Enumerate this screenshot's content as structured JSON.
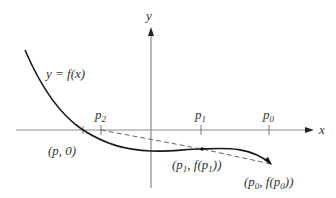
{
  "diagram": {
    "axes": {
      "x_label": "x",
      "y_label": "y",
      "color": "#888888"
    },
    "curve": {
      "label": "y = f(x)",
      "color": "#1a1a1a"
    },
    "secant_line": {
      "style": "dashed",
      "color": "#666666"
    },
    "ticks": [
      {
        "id": "p2",
        "base": "p",
        "sub": "2"
      },
      {
        "id": "p1",
        "base": "p",
        "sub": "1"
      },
      {
        "id": "p0",
        "base": "p",
        "sub": "0"
      }
    ],
    "points": [
      {
        "id": "root",
        "label": "(p, 0)"
      },
      {
        "id": "p1_point",
        "label_parts": [
          "(p",
          "1",
          ", f(p",
          "1",
          "))"
        ]
      },
      {
        "id": "p0_point",
        "label_parts": [
          "(p",
          "0",
          ", f(p",
          "0",
          "))"
        ]
      }
    ]
  }
}
